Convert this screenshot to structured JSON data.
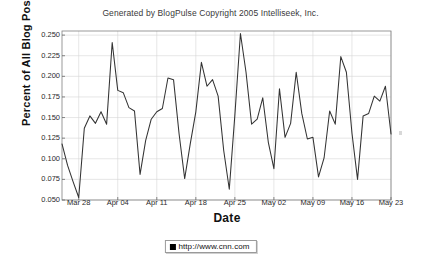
{
  "chart": {
    "title": "Generated by BlogPulse Copyright 2005 Intelliseek, Inc.",
    "xlabel": "Date",
    "ylabel": "Percent of All Blog Posts",
    "legend_label": "http://www.cnn.com",
    "legend_swatch_name": "legend-color-swatch",
    "line_color": "#333333",
    "grid_color": "#d5d5d5",
    "axis_color": "#808080"
  },
  "chart_data": {
    "type": "line",
    "title": "Generated by BlogPulse Copyright 2005 Intelliseek, Inc.",
    "xlabel": "Date",
    "ylabel": "Percent of All Blog Posts",
    "grid": true,
    "legend_position": "bottom-center",
    "ylim": [
      0.05,
      0.255
    ],
    "yticks": [
      0.05,
      0.075,
      0.1,
      0.125,
      0.15,
      0.175,
      0.2,
      0.225,
      0.25
    ],
    "ytick_labels": [
      "0.050",
      "0.075",
      "0.100",
      "0.125",
      "0.150",
      "0.175",
      "0.200",
      "0.225",
      "0.250"
    ],
    "xticks": [
      "Mar 28",
      "Apr 04",
      "Apr 11",
      "Apr 18",
      "Apr 25",
      "May 02",
      "May 09",
      "May 16",
      "May 23"
    ],
    "xtick_indices": [
      3,
      10,
      17,
      24,
      31,
      38,
      45,
      52,
      59
    ],
    "x": [
      "Mar 25",
      "Mar 26",
      "Mar 27",
      "Mar 28",
      "Mar 29",
      "Mar 30",
      "Mar 31",
      "Apr 01",
      "Apr 02",
      "Apr 03",
      "Apr 04",
      "Apr 05",
      "Apr 06",
      "Apr 07",
      "Apr 08",
      "Apr 09",
      "Apr 10",
      "Apr 11",
      "Apr 12",
      "Apr 13",
      "Apr 14",
      "Apr 15",
      "Apr 16",
      "Apr 17",
      "Apr 18",
      "Apr 19",
      "Apr 20",
      "Apr 21",
      "Apr 22",
      "Apr 23",
      "Apr 24",
      "Apr 25",
      "Apr 26",
      "Apr 27",
      "Apr 28",
      "Apr 29",
      "Apr 30",
      "May 01",
      "May 02",
      "May 03",
      "May 04",
      "May 05",
      "May 06",
      "May 07",
      "May 08",
      "May 09",
      "May 10",
      "May 11",
      "May 12",
      "May 13",
      "May 14",
      "May 15",
      "May 16",
      "May 17",
      "May 18",
      "May 19",
      "May 20",
      "May 21",
      "May 22",
      "May 23"
    ],
    "series": [
      {
        "name": "http://www.cnn.com",
        "color": "#333333",
        "values": [
          0.118,
          0.092,
          0.072,
          0.053,
          0.137,
          0.152,
          0.143,
          0.157,
          0.142,
          0.241,
          0.183,
          0.18,
          0.162,
          0.158,
          0.081,
          0.122,
          0.148,
          0.157,
          0.161,
          0.198,
          0.196,
          0.13,
          0.076,
          0.118,
          0.157,
          0.217,
          0.188,
          0.196,
          0.176,
          0.11,
          0.063,
          0.153,
          0.252,
          0.205,
          0.142,
          0.148,
          0.174,
          0.12,
          0.088,
          0.185,
          0.126,
          0.143,
          0.205,
          0.155,
          0.124,
          0.126,
          0.078,
          0.101,
          0.158,
          0.142,
          0.224,
          0.205,
          0.131,
          0.075,
          0.152,
          0.155,
          0.176,
          0.17,
          0.188,
          0.13
        ]
      }
    ],
    "min_value": 0.053,
    "max_value": 0.252,
    "point_count": 60
  }
}
